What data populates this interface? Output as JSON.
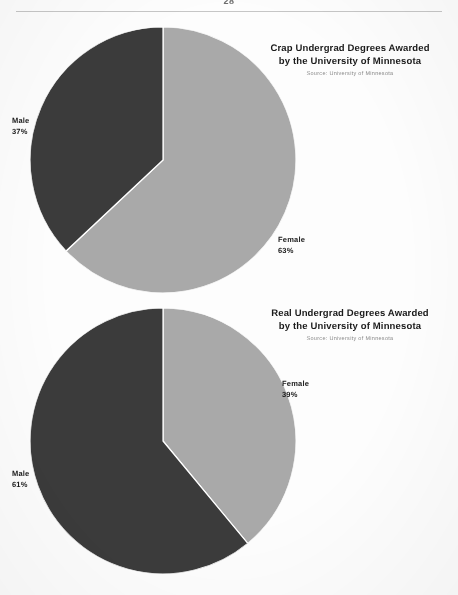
{
  "page": {
    "number": "28",
    "background_color": "#fdfdfd"
  },
  "colors": {
    "female_slice": "#a9a9a9",
    "male_slice": "#3b3b3b",
    "slice_divider": "#ffffff",
    "text": "#1b1b1b",
    "source_text": "#8a8a8a",
    "header_rule": "#c6c6c6"
  },
  "figures": [
    {
      "id": "crap-undergrad-degrees",
      "title_line_1": "Crap Undergrad Degrees Awarded",
      "title_line_2": "by the University of Minnesota",
      "source": "Source: University of Minnesota",
      "labels": {
        "male_name": "Male",
        "male_pct": "37%",
        "female_name": "Female",
        "female_pct": "63%"
      }
    },
    {
      "id": "real-undergrad-degrees",
      "title_line_1": "Real Undergrad Degrees Awarded",
      "title_line_2": "by the University of Minnesota",
      "source": "Source: University of Minnesota",
      "labels": {
        "male_name": "Male",
        "male_pct": "61%",
        "female_name": "Female",
        "female_pct": "39%"
      }
    }
  ],
  "chart_data": [
    {
      "type": "pie",
      "title": "Crap Undergrad Degrees Awarded by the University of Minnesota",
      "subtitle": "Source: University of Minnesota",
      "categories": [
        "Female",
        "Male"
      ],
      "values": [
        63,
        37
      ],
      "value_unit": "percent",
      "colors": [
        "#a9a9a9",
        "#3b3b3b"
      ],
      "start_angle_deg": 0,
      "direction": "clockwise",
      "legend": "none",
      "data_labels": [
        "Female 63%",
        "Male 37%"
      ],
      "grid": false
    },
    {
      "type": "pie",
      "title": "Real Undergrad Degrees Awarded by the University of Minnesota",
      "subtitle": "Source: University of Minnesota",
      "categories": [
        "Female",
        "Male"
      ],
      "values": [
        39,
        61
      ],
      "value_unit": "percent",
      "colors": [
        "#a9a9a9",
        "#3b3b3b"
      ],
      "start_angle_deg": 0,
      "direction": "clockwise",
      "legend": "none",
      "data_labels": [
        "Female 39%",
        "Male 61%"
      ],
      "grid": false
    }
  ]
}
